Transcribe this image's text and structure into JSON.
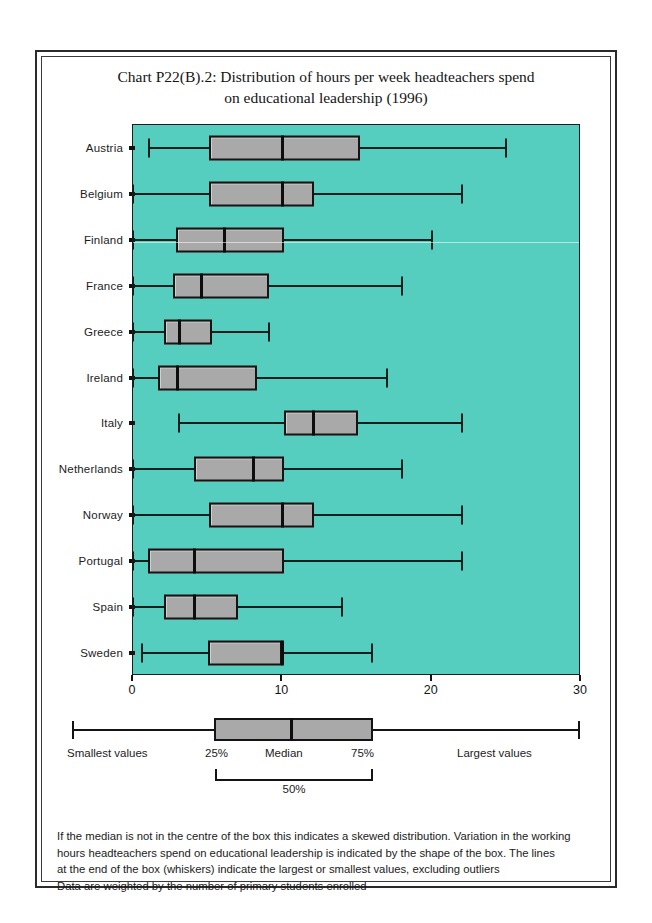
{
  "chart_data": {
    "type": "boxplot",
    "title": "Chart P22(B).2: Distribution of hours per week headteachers spend on educational leadership (1996)",
    "title_lines": [
      "Chart P22(B).2: Distribution of hours per week headteachers spend",
      "on educational leadership (1996)"
    ],
    "orientation": "horizontal",
    "xlabel": "",
    "ylabel": "",
    "xlim": [
      0,
      30
    ],
    "xticks": [
      0,
      10,
      20,
      30
    ],
    "xtick_labels": [
      "0",
      "10",
      "20",
      "30"
    ],
    "grid": false,
    "legend_position": "below-plot",
    "categories": [
      "Austria",
      "Belgium",
      "Finland",
      "France",
      "Greece",
      "Ireland",
      "Italy",
      "Netherlands",
      "Norway",
      "Portugal",
      "Spain",
      "Sweden"
    ],
    "boxes": [
      {
        "category": "Austria",
        "whisker_low": 1.1,
        "q1": 5.1,
        "median": 10.0,
        "q3": 15.2,
        "whisker_high": 25.0
      },
      {
        "category": "Belgium",
        "whisker_low": 0.0,
        "q1": 5.1,
        "median": 10.0,
        "q3": 12.1,
        "whisker_high": 22.0
      },
      {
        "category": "Finland",
        "whisker_low": 0.0,
        "q1": 2.9,
        "median": 6.1,
        "q3": 10.1,
        "whisker_high": 20.0
      },
      {
        "category": "France",
        "whisker_low": 0.0,
        "q1": 2.7,
        "median": 4.6,
        "q3": 9.1,
        "whisker_high": 18.0
      },
      {
        "category": "Greece",
        "whisker_low": 0.0,
        "q1": 2.1,
        "median": 3.1,
        "q3": 5.3,
        "whisker_high": 9.1
      },
      {
        "category": "Ireland",
        "whisker_low": 0.0,
        "q1": 1.7,
        "median": 3.0,
        "q3": 8.3,
        "whisker_high": 17.0
      },
      {
        "category": "Italy",
        "whisker_low": 3.1,
        "q1": 10.1,
        "median": 12.1,
        "q3": 15.1,
        "whisker_high": 22.0
      },
      {
        "category": "Netherlands",
        "whisker_low": 0.0,
        "q1": 4.1,
        "median": 8.1,
        "q3": 10.1,
        "whisker_high": 18.0
      },
      {
        "category": "Norway",
        "whisker_low": 0.0,
        "q1": 5.1,
        "median": 10.0,
        "q3": 12.1,
        "whisker_high": 22.0
      },
      {
        "category": "Portugal",
        "whisker_low": 0.0,
        "q1": 1.0,
        "median": 4.1,
        "q3": 10.1,
        "whisker_high": 22.0
      },
      {
        "category": "Spain",
        "whisker_low": 0.0,
        "q1": 2.1,
        "median": 4.1,
        "q3": 7.0,
        "whisker_high": 14.0
      },
      {
        "category": "Sweden",
        "whisker_low": 0.6,
        "q1": 5.0,
        "median": 10.0,
        "q3": 10.0,
        "whisker_high": 16.0
      }
    ]
  },
  "legend": {
    "smallest_label": "Smallest values",
    "q1_label": "25%",
    "median_label": "Median",
    "q3_label": "75%",
    "largest_label": "Largest values",
    "brace_label": "50%"
  },
  "footnote": {
    "lines": [
      "If the median is not in the centre of the box this indicates a skewed distribution. Variation in the working",
      "hours headteachers spend on educational leadership is indicated by the shape of the box. The lines",
      "at the end of the box (whiskers) indicate the largest or smallest values, excluding outliers",
      "Data are weighted by the number of primary students enrolled"
    ]
  },
  "colors": {
    "plot_background": "#55cec0",
    "box_fill": "#a9a9a9",
    "line": "#141414",
    "page_background": "#ffffff"
  }
}
